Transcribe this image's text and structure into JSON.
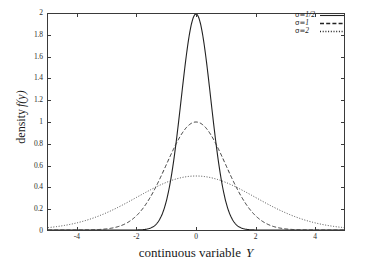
{
  "chart_data": {
    "type": "line",
    "title": "",
    "xlabel": "continuous variable  Y",
    "xlabel_text": "continuous variable",
    "xlabel_variable": "Y",
    "ylabel": "density f(y)",
    "ylabel_text": "density",
    "ylabel_variable": "f(y)",
    "xlim": [
      -5,
      5
    ],
    "ylim": [
      0,
      2
    ],
    "grid": false,
    "legend_position": "top-right",
    "x_ticks": [
      -4,
      -2,
      0,
      2,
      4
    ],
    "x_tick_labels": [
      "-4",
      "-2",
      "0",
      "2",
      "4"
    ],
    "y_ticks": [
      0,
      0.2,
      0.4,
      0.6,
      0.8,
      1,
      1.2,
      1.4,
      1.6,
      1.8,
      2
    ],
    "y_tick_labels": [
      "0",
      "0.2",
      "0.4",
      "0.6",
      "0.8",
      "1",
      "1.2",
      "1.4",
      "1.6",
      "1.8",
      "2"
    ],
    "series": [
      {
        "name": "sigma = 1/2",
        "legend_sigma": "σ=",
        "legend_value": "1/2",
        "sigma": 0.5,
        "peak": 2.0,
        "linestyle": "solid",
        "color": "#222222",
        "x": [
          -5,
          -4.5,
          -4,
          -3.5,
          -3,
          -2.5,
          -2,
          -1.75,
          -1.5,
          -1.25,
          -1,
          -0.75,
          -0.5,
          -0.25,
          0,
          0.25,
          0.5,
          0.75,
          1,
          1.25,
          1.5,
          1.75,
          2,
          2.5,
          3,
          3.5,
          4,
          4.5,
          5
        ],
        "y": [
          0,
          0,
          0,
          0,
          0,
          0,
          0.0007,
          0.0051,
          0.0265,
          0.0999,
          0.2707,
          0.5273,
          0.7358,
          0.8825,
          1.0,
          0.8825,
          0.7358,
          0.5273,
          0.2707,
          0.0999,
          0.0265,
          0.0051,
          0.0007,
          0,
          0,
          0,
          0,
          0,
          0
        ]
      },
      {
        "name": "sigma = 1",
        "legend_sigma": "σ=",
        "legend_value": "1",
        "sigma": 1.0,
        "peak": 1.0,
        "linestyle": "dashed",
        "color": "#333333",
        "x": [
          -5,
          -4.5,
          -4,
          -3.5,
          -3,
          -2.5,
          -2,
          -1.5,
          -1,
          -0.5,
          0,
          0.5,
          1,
          1.5,
          2,
          2.5,
          3,
          3.5,
          4,
          4.5,
          5
        ],
        "y": [
          0.0,
          0.0,
          0.0003,
          0.0022,
          0.0111,
          0.0439,
          0.1353,
          0.3247,
          0.6065,
          0.8825,
          1.0,
          0.8825,
          0.6065,
          0.3247,
          0.1353,
          0.0439,
          0.0111,
          0.0022,
          0.0003,
          0.0,
          0.0
        ]
      },
      {
        "name": "sigma = 2",
        "legend_sigma": "σ=",
        "legend_value": "2",
        "sigma": 2.0,
        "peak": 0.5,
        "linestyle": "dotted",
        "color": "#444444",
        "x": [
          -5,
          -4.5,
          -4,
          -3.5,
          -3,
          -2.5,
          -2,
          -1.5,
          -1,
          -0.5,
          0,
          0.5,
          1,
          1.5,
          2,
          2.5,
          3,
          3.5,
          4,
          4.5,
          5
        ],
        "y": [
          0.0439,
          0.0796,
          0.1353,
          0.2163,
          0.3247,
          0.4578,
          0.6065,
          0.7548,
          0.8825,
          0.9692,
          1.0,
          0.9692,
          0.8825,
          0.7548,
          0.6065,
          0.4578,
          0.3247,
          0.2163,
          0.1353,
          0.0796,
          0.0439
        ]
      }
    ]
  },
  "legend": {
    "entries": [
      {
        "label_prefix": "σ=",
        "label_value": "1/2",
        "style": "solid"
      },
      {
        "label_prefix": "σ=",
        "label_value": "1",
        "style": "dashed"
      },
      {
        "label_prefix": "σ=",
        "label_value": "2",
        "style": "dotted"
      }
    ]
  },
  "colors": {
    "axis": "#3a3a3a",
    "text": "#1a1a1a",
    "background": "#ffffff"
  }
}
